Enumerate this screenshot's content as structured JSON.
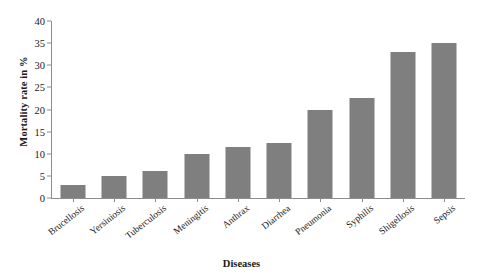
{
  "chart_data": {
    "type": "bar",
    "title": "",
    "xlabel": "Diseases",
    "ylabel": "Mortality rate in %",
    "categories": [
      "Brucellosis",
      "Yersiniosis",
      "Tuberculosis",
      "Meningitis",
      "Anthrax",
      "Diarrhea",
      "Pneumonia",
      "Syphilis",
      "Shigellosis",
      "Sepsis"
    ],
    "values": [
      3,
      5,
      6,
      10,
      11.5,
      12.5,
      20,
      22.5,
      33,
      35
    ],
    "ylim": [
      0,
      40
    ],
    "yticks": [
      0,
      5,
      10,
      15,
      20,
      25,
      30,
      35,
      40
    ],
    "ytick_labels": [
      "0",
      "5",
      "10",
      "15",
      "20",
      "25",
      "30",
      "35",
      "40"
    ],
    "grid": false,
    "legend": false,
    "bar_color": "#7f7f7f",
    "axis_color": "#8c8c8c"
  }
}
